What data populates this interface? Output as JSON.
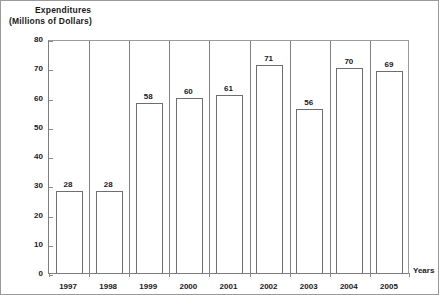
{
  "chart_data": {
    "type": "bar",
    "title": "Expenditures (Millions of Dollars)",
    "title_lines": [
      "Expenditures",
      "(Millions of Dollars)"
    ],
    "categories": [
      "1997",
      "1998",
      "1999",
      "2000",
      "2001",
      "2002",
      "2003",
      "2004",
      "2005"
    ],
    "values": [
      28,
      28,
      58,
      60,
      61,
      71,
      56,
      70,
      69
    ],
    "value_labels": [
      "28",
      "28",
      "58",
      "60",
      "61",
      "71",
      "56",
      "70",
      "69"
    ],
    "xlabel": "Years",
    "ylabel": "Expenditures (Millions of Dollars)",
    "ylim": [
      0,
      80
    ],
    "ytick_values": [
      80,
      70,
      60,
      50,
      40,
      30,
      20,
      10,
      0
    ],
    "ytick_labels": [
      "80",
      "70",
      "60",
      "50",
      "40",
      "30",
      "20",
      "10",
      "0"
    ],
    "grid": false,
    "legend": null,
    "bar_fill_color": "#ffffff",
    "bar_border_color": "#6e6e6e",
    "axis_color": "#7d7d7d",
    "text_color": "#1a1a1a"
  }
}
